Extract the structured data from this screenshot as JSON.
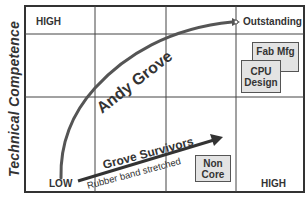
{
  "diagram": {
    "y_axis_label": "Technical Competence",
    "corner_labels": {
      "top_left": "HIGH",
      "bottom_left": "LOW",
      "bottom_right": "HIGH",
      "top_right": "Outstanding"
    },
    "curve": {
      "label": "Andy Grove",
      "from": "LOW",
      "to": "Outstanding"
    },
    "arrow": {
      "label_above": "Grove Survivors",
      "label_below": "Rubber band stretched"
    },
    "boxes": [
      {
        "id": "fab-mfg",
        "line1": "Fab Mfg",
        "line2": ""
      },
      {
        "id": "cpu-design",
        "line1": "CPU",
        "line2": "Design"
      },
      {
        "id": "non-core",
        "line1": "Non",
        "line2": "Core"
      }
    ],
    "colors": {
      "line": "#444444",
      "box_fill": "#e3e3e3",
      "text": "#333333"
    }
  }
}
